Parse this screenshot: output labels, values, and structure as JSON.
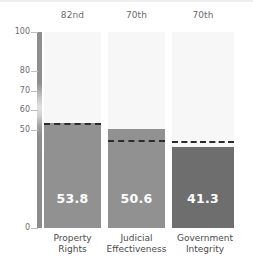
{
  "chart_data": {
    "type": "bar",
    "title": "",
    "xlabel": "",
    "ylabel": "",
    "ylim": [
      0,
      100
    ],
    "grid": false,
    "legend": "none",
    "categories": [
      "Property Rights",
      "Judicial Effectiveness",
      "Government Integrity"
    ],
    "category_lines": [
      [
        "Property",
        "Rights"
      ],
      [
        "Judicial",
        "Effectiveness"
      ],
      [
        "Government",
        "Integrity"
      ]
    ],
    "values": [
      53.8,
      50.6,
      41.3
    ],
    "value_labels": [
      "53.8",
      "50.6",
      "41.3"
    ],
    "percentile_labels": [
      "82nd",
      "70th",
      "70th"
    ],
    "reference_marks": [
      52.5,
      44.0,
      43.5
    ],
    "ytick_labels": [
      "100",
      "80",
      "70",
      "60",
      "50",
      "0"
    ],
    "ytick_values": [
      100,
      80,
      70,
      60,
      50,
      0
    ],
    "bar_colors": [
      "#919191",
      "#919191",
      "#6e6e6e"
    ],
    "column_background_color": "#f7f7f8",
    "reference_line_color": "#2b2b2b",
    "value_label_color": "#ffffff",
    "tick_text_color": "#6b6b6b",
    "category_text_color": "#4a4a4a"
  }
}
